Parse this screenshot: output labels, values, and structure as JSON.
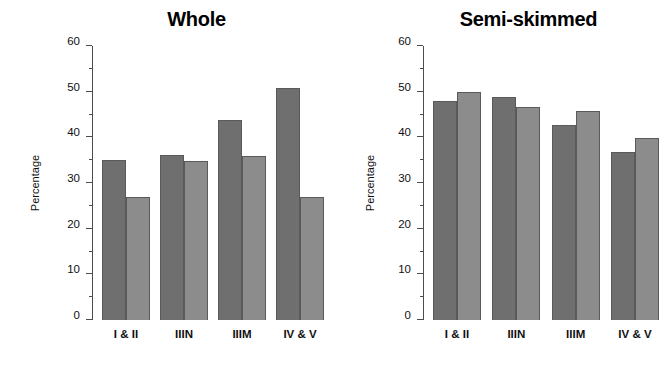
{
  "chart_data": [
    {
      "type": "bar",
      "title": "Whole",
      "xlabel": "",
      "ylabel": "Percentage",
      "categories": [
        "I & II",
        "IIIN",
        "IIIM",
        "IV & V"
      ],
      "ylim": [
        0,
        60
      ],
      "yticks": [
        0,
        10,
        20,
        30,
        40,
        50,
        60
      ],
      "ytick_labels": [
        "0",
        "10",
        "20",
        "30",
        "40",
        "50",
        "60"
      ],
      "minor_tick_step": 5,
      "grid": false,
      "legend": "none",
      "series": [
        {
          "name": "series-1",
          "color": "#6f6f6f",
          "values": [
            35.0,
            36.1,
            43.9,
            50.8
          ]
        },
        {
          "name": "series-2",
          "color": "#8c8c8c",
          "values": [
            27.0,
            34.8,
            36.0,
            27.0
          ]
        }
      ]
    },
    {
      "type": "bar",
      "title": "Semi-skimmed",
      "xlabel": "",
      "ylabel": "Percentage",
      "categories": [
        "I & II",
        "IIIN",
        "IIIM",
        "IV & V"
      ],
      "ylim": [
        0,
        60
      ],
      "yticks": [
        0,
        10,
        20,
        30,
        40,
        50,
        60
      ],
      "ytick_labels": [
        "0",
        "10",
        "20",
        "30",
        "40",
        "50",
        "60"
      ],
      "minor_tick_step": 5,
      "grid": false,
      "legend": "none",
      "series": [
        {
          "name": "series-1",
          "color": "#6f6f6f",
          "values": [
            48.0,
            48.8,
            42.7,
            36.7
          ]
        },
        {
          "name": "series-2",
          "color": "#8c8c8c",
          "values": [
            50.0,
            46.7,
            45.8,
            39.8
          ]
        }
      ]
    }
  ]
}
